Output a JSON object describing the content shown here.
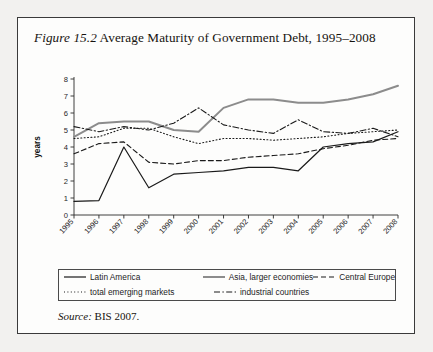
{
  "figure": {
    "number_label": "Figure 15.2",
    "title_text": " Average Maturity of Government Debt, 1995–2008",
    "source_word": "Source:",
    "source_text": " BIS 2007."
  },
  "legend": {
    "items": [
      {
        "label": "Latin America",
        "style": "solid",
        "color": "#1a1a1a",
        "width": 1.2
      },
      {
        "label": "Asia, larger economies",
        "style": "solid",
        "color": "#8c8c8c",
        "width": 2.0
      },
      {
        "label": "Central Europe",
        "style": "dashed",
        "color": "#1a1a1a",
        "width": 1.1
      },
      {
        "label": "total emerging markets",
        "style": "dotted",
        "color": "#1a1a1a",
        "width": 1.1
      },
      {
        "label": "industrial countries",
        "style": "dashdot",
        "color": "#1a1a1a",
        "width": 1.1
      }
    ]
  },
  "chart_data": {
    "type": "line",
    "title": "Average Maturity of Government Debt, 1995–2008",
    "xlabel": "",
    "ylabel": "years",
    "x": [
      1995,
      1996,
      1997,
      1998,
      1999,
      2000,
      2001,
      2002,
      2003,
      2004,
      2005,
      2006,
      2007,
      2008
    ],
    "categories": [
      "1995",
      "1996",
      "1997",
      "1998",
      "1999",
      "2000",
      "2001",
      "2002",
      "2003",
      "2004",
      "2005",
      "2006",
      "2007",
      "2008"
    ],
    "ylim": [
      0,
      8
    ],
    "yticks": [
      0,
      1,
      2,
      3,
      4,
      5,
      6,
      7,
      8
    ],
    "grid": false,
    "legend_position": "below",
    "series": [
      {
        "name": "Latin America",
        "style": "solid",
        "color": "#1a1a1a",
        "width": 1.2,
        "values": [
          0.8,
          0.85,
          4.0,
          1.6,
          2.4,
          2.5,
          2.6,
          2.8,
          2.8,
          2.6,
          4.0,
          4.2,
          4.3,
          4.9
        ]
      },
      {
        "name": "Asia, larger economies",
        "style": "solid",
        "color": "#8c8c8c",
        "width": 2.0,
        "values": [
          4.6,
          5.4,
          5.5,
          5.5,
          5.0,
          4.9,
          6.3,
          6.8,
          6.8,
          6.6,
          6.6,
          6.8,
          7.1,
          7.6
        ]
      },
      {
        "name": "Central Europe",
        "style": "dashed",
        "color": "#1a1a1a",
        "width": 1.1,
        "values": [
          3.6,
          4.2,
          4.3,
          3.1,
          3.0,
          3.2,
          3.2,
          3.4,
          3.5,
          3.6,
          3.9,
          4.1,
          4.4,
          4.5
        ]
      },
      {
        "name": "total emerging markets",
        "style": "dotted",
        "color": "#1a1a1a",
        "width": 1.1,
        "values": [
          4.5,
          4.6,
          5.1,
          5.1,
          4.6,
          4.2,
          4.5,
          4.5,
          4.4,
          4.5,
          4.6,
          4.8,
          4.9,
          5.0
        ]
      },
      {
        "name": "industrial countries",
        "style": "dashdot",
        "color": "#1a1a1a",
        "width": 1.1,
        "values": [
          5.2,
          4.9,
          5.2,
          5.0,
          5.4,
          6.3,
          5.3,
          5.0,
          4.8,
          5.6,
          4.9,
          4.8,
          5.1,
          4.6
        ]
      }
    ]
  }
}
